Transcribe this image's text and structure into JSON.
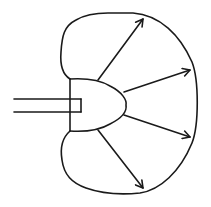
{
  "diagram": {
    "type": "radiation-pattern",
    "colors": {
      "stroke": "#1a1a1a",
      "background": "#ffffff"
    },
    "stroke_width": 1.6,
    "components": {
      "feed_stem": {
        "upper_line": {
          "x1": 14,
          "y1": 99,
          "x2": 81,
          "y2": 99
        },
        "lower_line": {
          "x1": 14,
          "y1": 112,
          "x2": 81,
          "y2": 112
        },
        "end_cap": {
          "x": 81,
          "y1": 99,
          "y2": 112
        }
      },
      "source_body": {
        "back_plate": {
          "x": 70,
          "y1": 79,
          "y2": 131
        }
      },
      "arrows": [
        {
          "label": "",
          "x1": 98,
          "y1": 80,
          "x2": 143,
          "y2": 19
        },
        {
          "label": "",
          "x1": 124,
          "y1": 92,
          "x2": 190,
          "y2": 70
        },
        {
          "label": "",
          "x1": 124,
          "y1": 115,
          "x2": 190,
          "y2": 137
        },
        {
          "label": "",
          "x1": 98,
          "y1": 130,
          "x2": 143,
          "y2": 188
        }
      ]
    },
    "labels": []
  }
}
